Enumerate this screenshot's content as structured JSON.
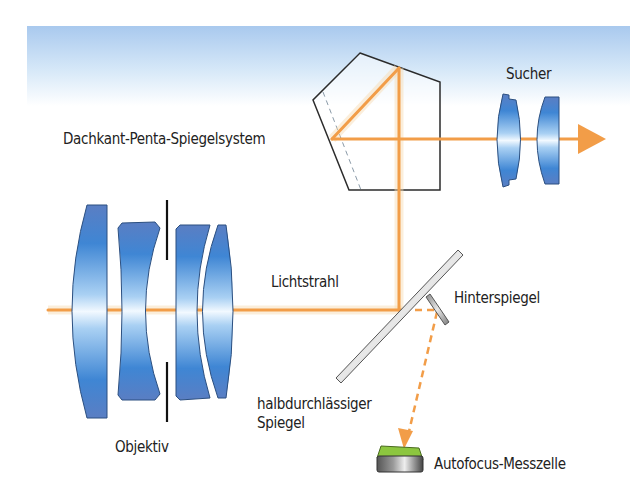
{
  "figure": {
    "colors": {
      "sky_top": "#a9c9ee",
      "beam": "#f29d48",
      "lens_dark": "#5a7ec3",
      "lens_mid": "#3b8ad9",
      "lens_light": "#eef7ff",
      "outline": "#2b2b2b",
      "mirror": "#b5b5b5",
      "sensor_top": "#8cc63f"
    }
  },
  "labels": {
    "pentaprism": "Dachkant-Penta-Spiegelsystem",
    "viewfinder": "Sucher",
    "light_ray": "Lichtstrahl",
    "secondary_mirror": "Hinterspiegel",
    "main_mirror_line1": "halbdurchlässiger",
    "main_mirror_line2": "Spiegel",
    "objective": "Objektiv",
    "af_sensor": "Autofocus-Messzelle"
  }
}
